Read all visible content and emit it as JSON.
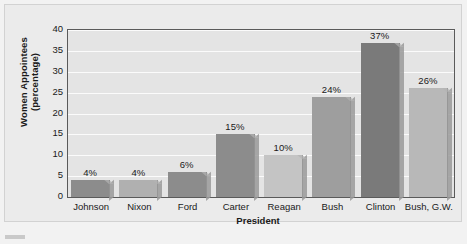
{
  "chart_data": {
    "type": "bar",
    "title": "",
    "xlabel": "President",
    "ylabel": "Women Appointees (percentage)",
    "ylabel_line1": "Women Appointees",
    "ylabel_line2": "(percentage)",
    "categories": [
      "Johnson",
      "Nixon",
      "Ford",
      "Carter",
      "Reagan",
      "Bush",
      "Clinton",
      "Bush, G.W."
    ],
    "values": [
      4,
      4,
      6,
      15,
      10,
      24,
      37,
      26
    ],
    "data_labels": [
      "4%",
      "4%",
      "6%",
      "15%",
      "10%",
      "24%",
      "37%",
      "26%"
    ],
    "ylim": [
      0,
      40
    ],
    "yticks": [
      40,
      35,
      30,
      25,
      20,
      15,
      10,
      5,
      0
    ],
    "ytick_labels": [
      "40",
      "35",
      "30",
      "25",
      "20",
      "15",
      "10",
      "5",
      "0"
    ],
    "grid": true,
    "legend": "none",
    "bar_colors": [
      "#8c8c8c",
      "#b0b0b0",
      "#8c8c8c",
      "#8c8c8c",
      "#c4c4c4",
      "#9e9e9e",
      "#7a7a7a",
      "#b8b8b8"
    ],
    "plot_background": "#e4e4e4",
    "gridline_color": "#fbfbfb",
    "frame_color": "#5a5a5a"
  }
}
